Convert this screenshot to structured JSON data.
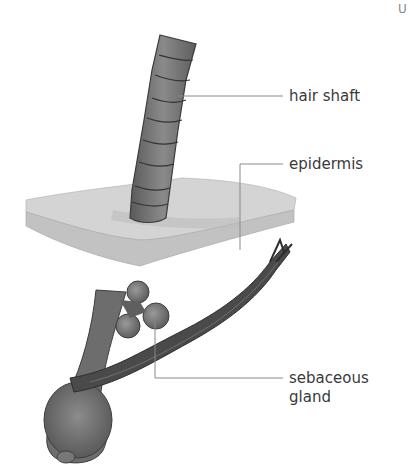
{
  "labels": {
    "hair_shaft": "hair shaft",
    "epidermis": "epidermis",
    "sebaceous_line1": "sebaceous",
    "sebaceous_line2": "gland"
  },
  "corner_mark": "U",
  "colors": {
    "hair": "#6f6f6f",
    "hair_dark": "#3c3c3c",
    "epidermis_top": "#cfcfcf",
    "epidermis_side": "#bdbdbd",
    "gland": "#5f5f5f",
    "muscle": "#4a4a4a",
    "leader_line": "#8a8a8a",
    "text": "#3a3a3a"
  }
}
